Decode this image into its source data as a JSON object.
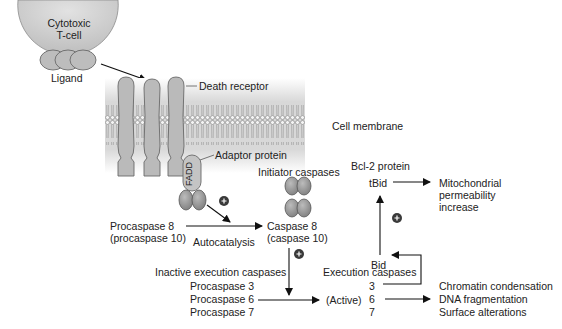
{
  "diagram": {
    "tcell": {
      "line1": "Cytotoxic",
      "line2": "T-cell"
    },
    "ligand": "Ligand",
    "death_receptor": "Death receptor",
    "cell_membrane": "Cell membrane",
    "adaptor_protein": "Adaptor protein",
    "fadd": "FADD",
    "initiator_caspases": "Initiator caspases",
    "procaspase8": {
      "line1": "Procaspase 8",
      "line2": "(procaspase 10)"
    },
    "autocatalysis": "Autocatalysis",
    "caspase8": {
      "line1": "Caspase 8",
      "line2": "(caspase 10)"
    },
    "bcl2_protein": "Bcl-2 protein",
    "tbid": "tBid",
    "bid": "Bid",
    "mitochondrial": {
      "line1": "Mitochondrial",
      "line2": "permeability",
      "line3": "increase"
    },
    "inactive_execution": "Inactive execution caspases",
    "procaspases": [
      "Procaspase 3",
      "Procaspase 6",
      "Procaspase 7"
    ],
    "execution_caspases": "Execution caspases",
    "active": "(Active)",
    "active_numbers": [
      "3",
      "6",
      "7"
    ],
    "outcomes": [
      "Chromatin condensation",
      "DNA fragmentation",
      "Surface alterations"
    ],
    "plus_sign": "+"
  },
  "colors": {
    "cell_fill": "#c9c9c9",
    "protein_fill": "#b5b5b5",
    "protein_stroke": "#6a6a6a",
    "caspase_fill": "#9a9a9a",
    "membrane_band": "#dcdcdc",
    "arrow": "#111111",
    "plus_badge": "#3a3a3a"
  }
}
